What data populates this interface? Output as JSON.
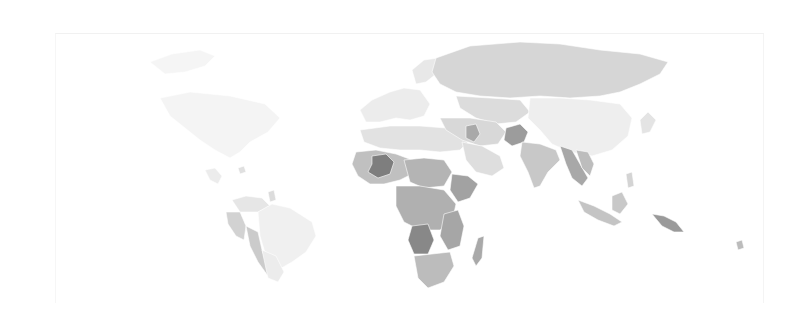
{
  "map": {
    "type": "choropleth",
    "projection": "equirectangular",
    "color_scale": "grayscale",
    "background": "#ffffff",
    "overlay_label": "",
    "regions": [
      {
        "name": "greenland",
        "fill": "#f5f5f5",
        "points": "150,62 172,54 200,50 215,56 205,66 185,72 165,74"
      },
      {
        "name": "north-america",
        "fill": "#f4f4f4",
        "points": "160,98 190,92 230,96 265,104 280,118 268,132 250,142 240,152 230,158 215,150 200,140 185,128 170,116"
      },
      {
        "name": "central-america",
        "fill": "#ececec",
        "points": "205,170 215,168 222,176 218,184 210,180"
      },
      {
        "name": "caribbean",
        "fill": "#e0e0e0",
        "points": "238,168 244,166 246,172 240,174"
      },
      {
        "name": "colombia-venezuela",
        "fill": "#e6e6e6",
        "points": "232,200 246,196 262,198 270,206 258,212 240,212"
      },
      {
        "name": "guyana-region",
        "fill": "#dcdcdc",
        "points": "268,192 274,190 276,200 270,202"
      },
      {
        "name": "peru-ecuador",
        "fill": "#d2d2d2",
        "points": "226,212 240,212 246,226 244,240 236,236 228,224"
      },
      {
        "name": "bolivia-chile",
        "fill": "#cbcbcb",
        "points": "246,226 258,232 262,250 268,268 276,272 268,276 258,262 250,246"
      },
      {
        "name": "brazil",
        "fill": "#f0f0f0",
        "points": "258,212 272,204 290,208 312,222 316,236 306,252 292,262 278,270 266,256 260,236"
      },
      {
        "name": "argentina",
        "fill": "#ececec",
        "points": "262,250 276,256 284,272 278,282 268,278"
      },
      {
        "name": "europe-west",
        "fill": "#ececec",
        "points": "360,110 372,100 390,92 404,88 420,90 430,104 424,116 410,120 396,118 380,122 366,122"
      },
      {
        "name": "scandinavia",
        "fill": "#e8e8e8",
        "points": "412,70 424,60 438,58 436,74 426,82 416,84"
      },
      {
        "name": "russia",
        "fill": "#d6d6d6",
        "points": "436,58 470,46 520,42 560,44 600,50 640,54 668,62 660,74 640,84 620,92 600,96 570,98 540,96 510,98 480,96 456,92 440,84 432,72"
      },
      {
        "name": "kazakhstan-central-asia",
        "fill": "#dcdcdc",
        "points": "456,96 490,98 520,100 530,112 516,122 496,124 476,118 460,108"
      },
      {
        "name": "mongolia-china",
        "fill": "#eeeeee",
        "points": "530,98 560,98 590,100 620,104 632,118 628,136 612,150 592,156 570,152 552,144 540,130 528,118"
      },
      {
        "name": "japan-korea",
        "fill": "#e4e4e4",
        "points": "640,120 648,112 656,120 650,132 642,134"
      },
      {
        "name": "middle-east-north-africa",
        "fill": "#e2e2e2",
        "points": "360,130 390,126 420,126 446,128 462,130 470,140 460,150 440,152 420,150 400,150 380,148 364,142"
      },
      {
        "name": "turkey-iran",
        "fill": "#d8d8d8",
        "points": "440,118 470,118 496,122 506,132 498,144 480,146 462,140 446,130"
      },
      {
        "name": "iraq",
        "fill": "#a9a9a9",
        "points": "466,126 476,124 480,134 474,142 466,138"
      },
      {
        "name": "arabia",
        "fill": "#dedede",
        "points": "462,142 482,146 500,156 504,168 492,176 476,172 466,160"
      },
      {
        "name": "afghanistan-pakistan",
        "fill": "#9c9c9c",
        "points": "506,128 520,124 528,132 524,142 512,146 504,140"
      },
      {
        "name": "india",
        "fill": "#c8c8c8",
        "points": "522,142 540,144 556,150 560,160 548,172 540,186 534,188 528,172 520,156"
      },
      {
        "name": "myanmar-thailand",
        "fill": "#a8a8a8",
        "points": "560,146 572,150 580,164 588,178 582,186 572,178 566,164"
      },
      {
        "name": "indochina",
        "fill": "#bdbdbd",
        "points": "576,150 588,152 594,164 590,176 582,168"
      },
      {
        "name": "west-africa-sahel",
        "fill": "#c0c0c0",
        "points": "356,152 376,150 396,154 412,160 412,174 400,180 384,184 370,184 358,176 352,164"
      },
      {
        "name": "mali-niger-dark",
        "fill": "#7e7e7e",
        "points": "372,156 386,154 394,162 390,174 378,178 368,172 372,164"
      },
      {
        "name": "chad-sudan",
        "fill": "#b4b4b4",
        "points": "404,160 424,158 444,160 452,172 444,186 424,188 410,182"
      },
      {
        "name": "horn-of-africa",
        "fill": "#a2a2a2",
        "points": "452,174 468,176 478,184 470,198 458,202 450,190"
      },
      {
        "name": "central-africa",
        "fill": "#b0b0b0",
        "points": "396,186 420,186 444,190 456,204 452,222 440,230 420,230 404,222 396,206"
      },
      {
        "name": "angola-drc-dark",
        "fill": "#888888",
        "points": "412,226 428,224 434,240 428,254 414,254 408,240"
      },
      {
        "name": "east-africa",
        "fill": "#a6a6a6",
        "points": "444,214 458,210 464,226 460,246 448,250 440,236"
      },
      {
        "name": "southern-africa",
        "fill": "#bcbcbc",
        "points": "414,256 432,254 450,252 454,266 444,282 428,288 418,278"
      },
      {
        "name": "madagascar",
        "fill": "#a9a9a9",
        "points": "478,238 484,236 482,258 476,266 472,258"
      },
      {
        "name": "indonesia",
        "fill": "#c4c4c4",
        "points": "578,200 594,206 610,214 622,222 614,226 598,220 584,212"
      },
      {
        "name": "borneo",
        "fill": "#c8c8c8",
        "points": "612,196 622,192 628,204 620,214 612,210"
      },
      {
        "name": "philippines",
        "fill": "#d4d4d4",
        "points": "626,174 632,172 634,186 628,188"
      },
      {
        "name": "papua-new-guinea",
        "fill": "#9a9a9a",
        "points": "652,214 664,216 676,222 684,232 674,232 662,226"
      },
      {
        "name": "pacific-islands",
        "fill": "#bcbcbc",
        "points": "736,242 742,240 744,248 738,250"
      }
    ]
  }
}
